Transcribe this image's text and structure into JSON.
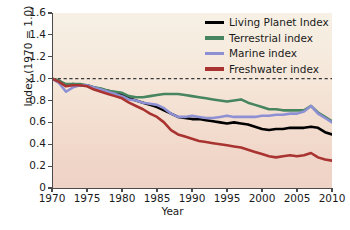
{
  "chart_data": {
    "type": "line",
    "title": "",
    "xlabel": "Year",
    "ylabel": "Index (1970 = 1.0)",
    "xlim": [
      1970,
      2010
    ],
    "ylim": [
      0,
      1.6
    ],
    "xticks": [
      1970,
      1975,
      1980,
      1985,
      1990,
      1995,
      2000,
      2005,
      2010
    ],
    "xtick_labels": [
      "1970",
      "1975",
      "1980",
      "1985",
      "1990",
      "1995",
      "2000",
      "2005",
      "2010"
    ],
    "yticks": [
      0,
      0.2,
      0.4,
      0.6,
      0.8,
      1.0,
      1.2,
      1.4,
      1.6
    ],
    "ytick_labels": [
      "0",
      "0.2",
      "0.4",
      "0.6",
      "0.8",
      "1.0",
      "1.2",
      "1.4",
      "1.6"
    ],
    "grid": false,
    "legend_position": "top-right",
    "reference_line": {
      "y": 1.0,
      "style": "dashed",
      "color": "#3a3a3a"
    },
    "plot_background_gradient": [
      "#f7f0e4",
      "#eed2c5"
    ],
    "x": [
      1970,
      1971,
      1972,
      1973,
      1974,
      1975,
      1976,
      1977,
      1978,
      1979,
      1980,
      1981,
      1982,
      1983,
      1984,
      1985,
      1986,
      1987,
      1988,
      1989,
      1990,
      1991,
      1992,
      1993,
      1994,
      1995,
      1996,
      1997,
      1998,
      1999,
      2000,
      2001,
      2002,
      2003,
      2004,
      2005,
      2006,
      2007,
      2008,
      2009,
      2010
    ],
    "series": [
      {
        "name": "Living Planet Index",
        "color": "#000000",
        "values": [
          1.0,
          0.98,
          0.94,
          0.95,
          0.94,
          0.94,
          0.92,
          0.9,
          0.89,
          0.87,
          0.85,
          0.82,
          0.8,
          0.78,
          0.76,
          0.74,
          0.71,
          0.68,
          0.65,
          0.64,
          0.63,
          0.63,
          0.62,
          0.61,
          0.6,
          0.59,
          0.6,
          0.59,
          0.58,
          0.56,
          0.54,
          0.53,
          0.54,
          0.54,
          0.55,
          0.55,
          0.55,
          0.56,
          0.55,
          0.51,
          0.49
        ]
      },
      {
        "name": "Terrestrial index",
        "color": "#46855f",
        "values": [
          1.0,
          0.98,
          0.95,
          0.95,
          0.95,
          0.94,
          0.92,
          0.91,
          0.89,
          0.88,
          0.87,
          0.84,
          0.83,
          0.83,
          0.84,
          0.85,
          0.86,
          0.86,
          0.86,
          0.85,
          0.84,
          0.83,
          0.82,
          0.81,
          0.8,
          0.79,
          0.8,
          0.81,
          0.78,
          0.76,
          0.74,
          0.72,
          0.72,
          0.71,
          0.71,
          0.71,
          0.71,
          0.75,
          0.69,
          0.65,
          0.61
        ]
      },
      {
        "name": "Marine index",
        "color": "#8e90d4",
        "values": [
          1.0,
          0.96,
          0.88,
          0.92,
          0.94,
          0.94,
          0.92,
          0.9,
          0.88,
          0.86,
          0.84,
          0.81,
          0.8,
          0.78,
          0.77,
          0.76,
          0.73,
          0.68,
          0.65,
          0.65,
          0.66,
          0.65,
          0.64,
          0.64,
          0.65,
          0.66,
          0.65,
          0.65,
          0.65,
          0.65,
          0.66,
          0.66,
          0.67,
          0.67,
          0.68,
          0.68,
          0.7,
          0.75,
          0.68,
          0.64,
          0.6
        ]
      },
      {
        "name": "Freshwater index",
        "color": "#a93330",
        "values": [
          1.0,
          0.97,
          0.93,
          0.94,
          0.94,
          0.93,
          0.9,
          0.88,
          0.86,
          0.84,
          0.82,
          0.78,
          0.75,
          0.72,
          0.68,
          0.65,
          0.6,
          0.53,
          0.49,
          0.47,
          0.45,
          0.43,
          0.42,
          0.41,
          0.4,
          0.39,
          0.38,
          0.37,
          0.35,
          0.33,
          0.31,
          0.29,
          0.28,
          0.29,
          0.3,
          0.29,
          0.3,
          0.32,
          0.28,
          0.26,
          0.25
        ]
      }
    ]
  },
  "legend": {
    "items": [
      {
        "label": "Living Planet Index",
        "color": "#000000"
      },
      {
        "label": "Terrestrial index",
        "color": "#46855f"
      },
      {
        "label": "Marine index",
        "color": "#8e90d4"
      },
      {
        "label": "Freshwater index",
        "color": "#a93330"
      }
    ]
  }
}
